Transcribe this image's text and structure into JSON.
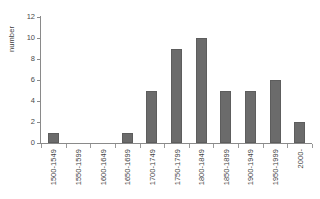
{
  "chart_data": {
    "type": "bar",
    "title": "",
    "xlabel": "",
    "ylabel": "number",
    "categories": [
      "1500-1549",
      "1550-1599",
      "1600-1649",
      "1650-1699",
      "1700-1749",
      "1750-1799",
      "1800-1849",
      "1850-1899",
      "1900-1949",
      "1950-1999",
      "2000-"
    ],
    "values": [
      1,
      0,
      0,
      1,
      5,
      9,
      10,
      5,
      5,
      6,
      2
    ],
    "ylim": [
      0,
      12
    ],
    "yticks": [
      0,
      2,
      4,
      6,
      8,
      10,
      12
    ],
    "ytick_labels": [
      "0",
      "2",
      "4",
      "6",
      "8",
      "10",
      "12"
    ],
    "grid": false,
    "legend": false,
    "bar_color": "#6b6b6b",
    "axis_color": "#8a8a8a",
    "background": "#ffffff"
  }
}
